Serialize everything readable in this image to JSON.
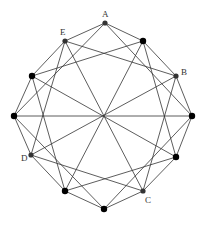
{
  "diagram": {
    "type": "graph",
    "vertices": [
      {
        "id": "A",
        "label": "A",
        "x": 105,
        "y": 23,
        "r": 2.6,
        "color": "#333333",
        "lx": 102,
        "ly": 17
      },
      {
        "id": "v1",
        "label": "",
        "x": 143,
        "y": 41,
        "r": 3.2,
        "color": "#000000"
      },
      {
        "id": "B",
        "label": "B",
        "x": 176,
        "y": 76,
        "r": 2.6,
        "color": "#333333",
        "lx": 181,
        "ly": 75
      },
      {
        "id": "v3",
        "label": "",
        "x": 192,
        "y": 116,
        "r": 3.2,
        "color": "#000000"
      },
      {
        "id": "v4",
        "label": "",
        "x": 176,
        "y": 157,
        "r": 3.2,
        "color": "#000000"
      },
      {
        "id": "C",
        "label": "C",
        "x": 143,
        "y": 191,
        "r": 2.6,
        "color": "#333333",
        "lx": 145,
        "ly": 203
      },
      {
        "id": "v6",
        "label": "",
        "x": 104,
        "y": 209,
        "r": 3.2,
        "color": "#000000"
      },
      {
        "id": "v7",
        "label": "",
        "x": 65,
        "y": 191,
        "r": 3.2,
        "color": "#000000"
      },
      {
        "id": "D",
        "label": "D",
        "x": 31,
        "y": 155,
        "r": 2.6,
        "color": "#333333",
        "lx": 21,
        "ly": 161
      },
      {
        "id": "v9",
        "label": "",
        "x": 14,
        "y": 116,
        "r": 3.2,
        "color": "#000000"
      },
      {
        "id": "v10",
        "label": "",
        "x": 32,
        "y": 76,
        "r": 3.2,
        "color": "#000000"
      },
      {
        "id": "E",
        "label": "E",
        "x": 65,
        "y": 41,
        "r": 2.6,
        "color": "#333333",
        "lx": 60,
        "ly": 35
      }
    ],
    "edges": [
      [
        0,
        1
      ],
      [
        1,
        2
      ],
      [
        2,
        3
      ],
      [
        3,
        4
      ],
      [
        4,
        5
      ],
      [
        5,
        6
      ],
      [
        6,
        7
      ],
      [
        7,
        8
      ],
      [
        8,
        9
      ],
      [
        9,
        10
      ],
      [
        10,
        11
      ],
      [
        11,
        0
      ],
      [
        0,
        3
      ],
      [
        1,
        4
      ],
      [
        2,
        5
      ],
      [
        3,
        6
      ],
      [
        4,
        7
      ],
      [
        5,
        8
      ],
      [
        6,
        9
      ],
      [
        7,
        10
      ],
      [
        8,
        11
      ],
      [
        9,
        0
      ],
      [
        10,
        1
      ],
      [
        11,
        2
      ],
      [
        1,
        7
      ],
      [
        2,
        8
      ],
      [
        3,
        9
      ],
      [
        4,
        10
      ],
      [
        5,
        11
      ]
    ],
    "edge_color": "#333333"
  }
}
